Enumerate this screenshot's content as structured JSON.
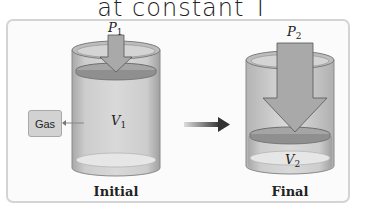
{
  "caption": "at constant T",
  "initial": {
    "pressure_label": "P",
    "pressure_sub": "1",
    "volume_label": "V",
    "volume_sub": "1",
    "title": "Initial"
  },
  "final": {
    "pressure_label": "P",
    "pressure_sub": "2",
    "volume_label": "V",
    "volume_sub": "2",
    "title": "Final"
  },
  "gas_label": "Gas",
  "colors": {
    "cylinder_fill": "#c8c8c8",
    "cylinder_edge": "#8a8a8a",
    "arrow_fill": "#a9a9a9",
    "process_arrow": "#333333",
    "panel_border": "#d4d4d4"
  }
}
